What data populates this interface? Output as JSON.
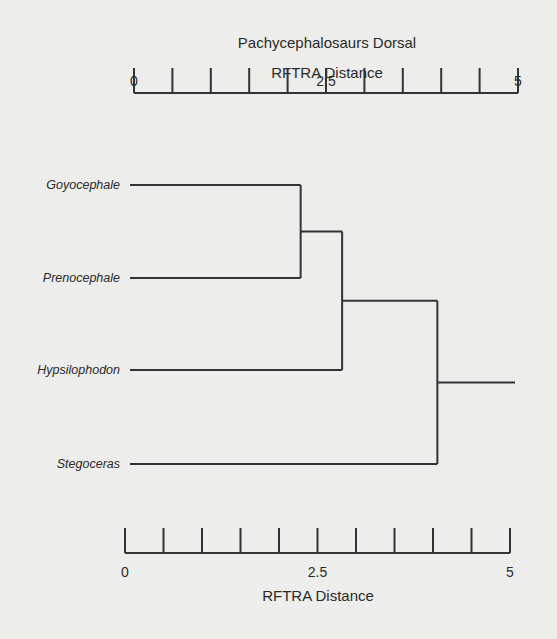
{
  "chart_data": {
    "type": "dendrogram",
    "title": "Pachycephalosaurs Dorsal",
    "top_axis_label": "RFTRA Distance",
    "bottom_axis_label": "RFTRA Distance",
    "xlim": [
      0,
      5
    ],
    "major_ticks": [
      0,
      2.5,
      5
    ],
    "tick_labels": [
      "0",
      "2.5",
      "5"
    ],
    "minor_tick_step": 0.5,
    "leaves": [
      "Goyocephale",
      "Prenocephale",
      "Hypsilophodon",
      "Stegoceras"
    ],
    "merges": [
      {
        "left": "Goyocephale",
        "right": "Prenocephale",
        "distance": 2.17
      },
      {
        "left": "Goyocephale+Prenocephale",
        "right": "Hypsilophodon",
        "distance": 2.71
      },
      {
        "left": "Goyocephale+Prenocephale+Hypsilophodon",
        "right": "Stegoceras",
        "distance": 3.95
      }
    ],
    "root_extends_to": 5
  }
}
